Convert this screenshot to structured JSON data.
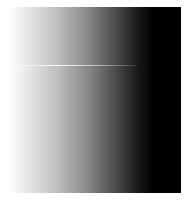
{
  "image": {
    "description": "grayscale horizontal gradient panel",
    "gradient": {
      "direction": "left-to-right",
      "start_color": "#ffffff",
      "end_color": "#000000"
    },
    "highlight_line": {
      "color": "#ffffff",
      "orientation": "horizontal"
    }
  }
}
